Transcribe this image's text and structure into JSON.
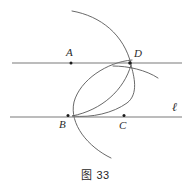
{
  "figure": {
    "caption": "图 33",
    "background_color": "#ffffff",
    "stroke_color": "#4a4a4a",
    "line_color": "#707070",
    "dot_color": "#1a1a1a",
    "text_color": "#2b2b2b",
    "width": 191,
    "height": 190
  },
  "points": [
    {
      "id": "A",
      "label": "A",
      "x": 71,
      "y": 63
    },
    {
      "id": "B",
      "label": "B",
      "x": 68,
      "y": 116
    },
    {
      "id": "C",
      "label": "C",
      "x": 124,
      "y": 116
    },
    {
      "id": "D",
      "label": "D",
      "x": 130,
      "y": 63
    }
  ],
  "lines": [
    {
      "id": "line-top",
      "label": "",
      "x1": 12,
      "y1": 63,
      "x2": 182,
      "y2": 63
    },
    {
      "id": "line-bottom",
      "label": "ℓ",
      "x1": 10,
      "y1": 117,
      "x2": 182,
      "y2": 117
    }
  ],
  "arcs": [
    {
      "id": "arc-upper-left",
      "description": "large construction arc from upper-left sweeping down through D",
      "path": "M 72 11 C 101 16 124 35 131 64"
    },
    {
      "id": "arc-through-D-right",
      "description": "construction arc crossing line at D and continuing lower-right",
      "path": "M 114 66 C 128 66 146 70 158 78"
    },
    {
      "id": "arc-circle-BD",
      "description": "circle arc through D curving left and down past B toward lower arc tip",
      "path": "M 131 61 C 104 64 77 82 72 104 C 68 124 86 146 110 158"
    },
    {
      "id": "arc-circle-CD",
      "description": "circle arc from D bending left and down meeting line near B and C",
      "path": "M 131 64 C 122 88 100 109 72 116 C 90 117 110 114 126 105 C 138 98 133 78 131 64"
    }
  ],
  "labels": {
    "A": "A",
    "B": "B",
    "C": "C",
    "D": "D",
    "ell": "ℓ"
  }
}
